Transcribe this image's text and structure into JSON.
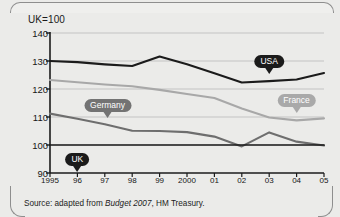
{
  "figure": {
    "unit_label": "UK=100",
    "caption_prefix": "Source: adapted from ",
    "caption_italic": "Budget 2007",
    "caption_suffix": ", HM Treasury."
  },
  "chart_data": {
    "type": "line",
    "title": "",
    "subtitle": "",
    "xlabel": "",
    "ylabel": "UK=100",
    "grid": true,
    "legend": "inline-callout-labels",
    "ylim": [
      90,
      140
    ],
    "yticks": [
      140,
      130,
      120,
      110,
      100,
      90
    ],
    "xlim": [
      1995,
      2005
    ],
    "x": [
      1995,
      1996,
      1997,
      1998,
      1999,
      2000,
      2001,
      2002,
      2003,
      2004,
      2005
    ],
    "tick_labels": [
      "1995",
      "96",
      "97",
      "98",
      "99",
      "2000",
      "01",
      "02",
      "03",
      "04",
      "05"
    ],
    "series": [
      {
        "name": "USA",
        "color": "#1b1b1b",
        "width": 2.1,
        "label_x": 2003,
        "values": [
          130.0,
          129.6,
          128.8,
          128.2,
          131.6,
          128.8,
          125.6,
          122.3,
          122.8,
          123.4,
          125.7
        ]
      },
      {
        "name": "France",
        "color": "#a8a8a8",
        "width": 2.1,
        "label_x": 2004,
        "values": [
          123.2,
          122.4,
          121.6,
          121.0,
          119.7,
          118.2,
          116.8,
          113.0,
          109.8,
          108.8,
          109.5
        ]
      },
      {
        "name": "Germany",
        "color": "#6e6e6e",
        "width": 2.1,
        "label_x": 1997,
        "values": [
          111.2,
          109.4,
          107.4,
          105.1,
          105.0,
          104.6,
          103.0,
          99.5,
          104.5,
          101.2,
          99.8
        ]
      },
      {
        "name": "UK",
        "color": "#1b1b1b",
        "width": 1.7,
        "label_x": 1996,
        "values": [
          100,
          100,
          100,
          100,
          100,
          100,
          100,
          100,
          100,
          100,
          100
        ]
      }
    ],
    "callouts": [
      {
        "text": "USA",
        "color": "#1b1b1b",
        "x": 2003,
        "y_px": 55,
        "tail": true
      },
      {
        "text": "France",
        "color": "#a9a9a9",
        "x": 2004,
        "y_px": 94,
        "tail": true
      },
      {
        "text": "Germany",
        "color": "#737373",
        "x": 1997.1,
        "y_px": 99,
        "tail": true
      },
      {
        "text": "UK",
        "color": "#1b1b1b",
        "x": 1996,
        "y_px": 153,
        "tail": true
      }
    ]
  }
}
